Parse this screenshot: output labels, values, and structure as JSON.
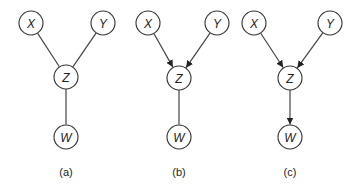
{
  "nodes_radius": 12,
  "panels": [
    {
      "id": "a",
      "caption": "(a)",
      "nodes": [
        {
          "id": "X",
          "label": "X",
          "x": 31,
          "y": 23
        },
        {
          "id": "Y",
          "label": "Y",
          "x": 103,
          "y": 23
        },
        {
          "id": "Z",
          "label": "Z",
          "x": 66,
          "y": 77
        },
        {
          "id": "W",
          "label": "W",
          "x": 66,
          "y": 137
        }
      ],
      "edges": [
        {
          "from": "X",
          "to": "Z",
          "directed": false
        },
        {
          "from": "Y",
          "to": "Z",
          "directed": false
        },
        {
          "from": "Z",
          "to": "W",
          "directed": false
        }
      ],
      "caption_pos": {
        "x": 66,
        "y": 176
      }
    },
    {
      "id": "b",
      "caption": "(b)",
      "nodes": [
        {
          "id": "X",
          "label": "X",
          "x": 148,
          "y": 23
        },
        {
          "id": "Y",
          "label": "Y",
          "x": 217,
          "y": 23
        },
        {
          "id": "Z",
          "label": "Z",
          "x": 179,
          "y": 78
        },
        {
          "id": "W",
          "label": "W",
          "x": 179,
          "y": 137
        }
      ],
      "edges": [
        {
          "from": "X",
          "to": "Z",
          "directed": true
        },
        {
          "from": "Y",
          "to": "Z",
          "directed": true
        },
        {
          "from": "Z",
          "to": "W",
          "directed": false
        }
      ],
      "caption_pos": {
        "x": 179,
        "y": 176
      }
    },
    {
      "id": "c",
      "caption": "(c)",
      "nodes": [
        {
          "id": "X",
          "label": "X",
          "x": 254,
          "y": 23
        },
        {
          "id": "Y",
          "label": "Y",
          "x": 330,
          "y": 23
        },
        {
          "id": "Z",
          "label": "Z",
          "x": 290,
          "y": 78
        },
        {
          "id": "W",
          "label": "W",
          "x": 290,
          "y": 137
        }
      ],
      "edges": [
        {
          "from": "X",
          "to": "Z",
          "directed": true
        },
        {
          "from": "Y",
          "to": "Z",
          "directed": true
        },
        {
          "from": "Z",
          "to": "W",
          "directed": true
        }
      ],
      "caption_pos": {
        "x": 290,
        "y": 176
      }
    }
  ]
}
